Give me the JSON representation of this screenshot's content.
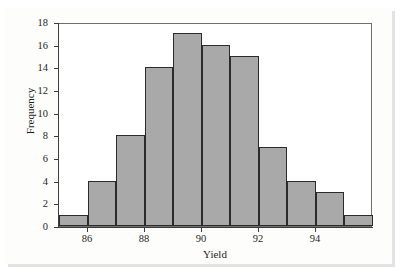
{
  "chart_data": {
    "type": "bar",
    "title": "",
    "subtitle": "",
    "xlabel": "Yield",
    "ylabel": "Frequency",
    "grid": false,
    "legend": "none",
    "xlim": [
      85,
      96
    ],
    "ylim": [
      0,
      18
    ],
    "x_tick_labels": [
      "86",
      "88",
      "90",
      "92",
      "94"
    ],
    "x_tick_values": [
      86,
      88,
      90,
      92,
      94
    ],
    "y_tick_labels": [
      "0",
      "2",
      "4",
      "6",
      "8",
      "10",
      "12",
      "14",
      "16",
      "18"
    ],
    "y_tick_values": [
      0,
      2,
      4,
      6,
      8,
      10,
      12,
      14,
      16,
      18
    ],
    "bin_width": 1,
    "bin_edges": [
      85,
      86,
      87,
      88,
      89,
      90,
      91,
      92,
      93,
      94,
      95,
      96
    ],
    "bin_centers": [
      85.5,
      86.5,
      87.5,
      88.5,
      89.5,
      90.5,
      91.5,
      92.5,
      93.5,
      94.5,
      95.5
    ],
    "categories": [
      "85-86",
      "86-87",
      "87-88",
      "88-89",
      "89-90",
      "90-91",
      "91-92",
      "92-93",
      "93-94",
      "94-95",
      "95-96"
    ],
    "values": [
      1,
      4,
      8,
      14,
      17,
      16,
      15,
      7,
      4,
      3,
      1
    ],
    "total_count": 90,
    "bar_fill_color": "#a9a9a9",
    "bar_edge_color": "#2b2b2b",
    "axis_color": "#3d3d3d",
    "plot_background": "#ffffff",
    "figure_background": "#fdfdfc",
    "figure_border_color": "#3a3a3a"
  }
}
